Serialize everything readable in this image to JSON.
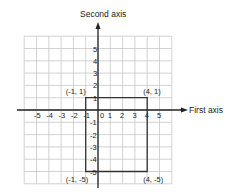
{
  "diagram": {
    "type": "coordinate-plane",
    "axes": {
      "x_label": "First axis",
      "y_label": "Second axis",
      "x_ticks": [
        "-5",
        "-4",
        "-3",
        "-2",
        "-1",
        "0",
        "1",
        "2",
        "3",
        "4",
        "5"
      ],
      "y_ticks_positive": [
        "1",
        "2",
        "3",
        "4",
        "5"
      ],
      "y_ticks_negative": [
        "-1",
        "-2",
        "-3",
        "-4",
        "-5"
      ]
    },
    "rectangle": {
      "vertices": [
        {
          "x": -1,
          "y": 1,
          "label": "(-1, 1)"
        },
        {
          "x": 4,
          "y": 1,
          "label": "(4, 1)"
        },
        {
          "x": 4,
          "y": -5,
          "label": "(4, -5)"
        },
        {
          "x": -1,
          "y": -5,
          "label": "(-1, -5)"
        }
      ]
    },
    "grid": {
      "x_range": [
        -6,
        6
      ],
      "y_range": [
        -6,
        6
      ]
    },
    "colors": {
      "grid": "#c8c8c8",
      "axis": "#222222",
      "shape": "#333333",
      "background": "#ffffff"
    }
  }
}
